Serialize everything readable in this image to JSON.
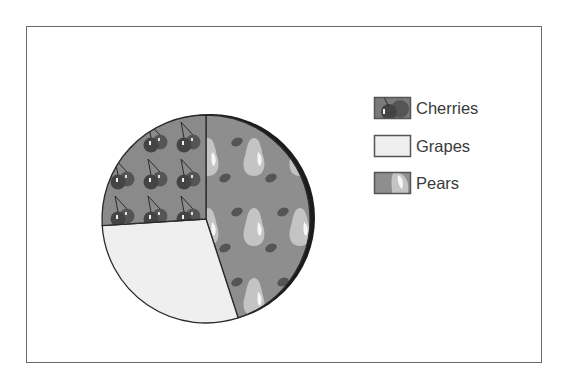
{
  "chart_data": {
    "type": "pie",
    "title": "",
    "categories": [
      "Cherries",
      "Grapes",
      "Pears"
    ],
    "values": [
      26,
      29,
      45
    ],
    "units": "percent (estimated from slice angles)",
    "slice_order_clockwise_from_top": [
      "Pears",
      "Grapes",
      "Cherries"
    ],
    "legend": {
      "position": "right",
      "entries": [
        {
          "label": "Cherries",
          "fill": "cherry-pattern"
        },
        {
          "label": "Grapes",
          "fill": "light-gray"
        },
        {
          "label": "Pears",
          "fill": "pear-pattern"
        }
      ]
    },
    "colors": {
      "Cherries": "#8a8a8a",
      "Grapes": "#efefef",
      "Pears": "#8e8e8e"
    },
    "shadow": true
  },
  "legend": {
    "items": [
      {
        "label": "Cherries"
      },
      {
        "label": "Grapes"
      },
      {
        "label": "Pears"
      }
    ]
  }
}
